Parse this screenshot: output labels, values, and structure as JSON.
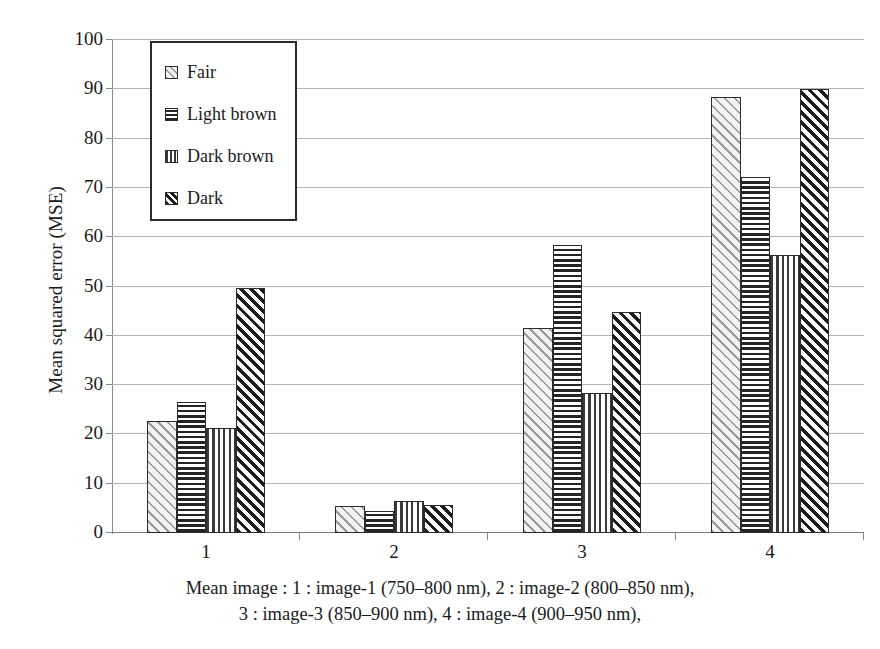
{
  "chart_data": {
    "type": "bar",
    "title": "",
    "xlabel": "",
    "ylabel": "Mean squared error (MSE)",
    "categories": [
      "1",
      "2",
      "3",
      "4"
    ],
    "ylim": [
      0,
      100
    ],
    "yticks": [
      0,
      10,
      20,
      30,
      40,
      50,
      60,
      70,
      80,
      90,
      100
    ],
    "grid": true,
    "legend_position": "upper-left-inside",
    "series": [
      {
        "name": "Fair",
        "pattern": "diagonal-forward-light",
        "values": [
          22.7,
          5.5,
          41.5,
          88.5
        ]
      },
      {
        "name": "Light brown",
        "pattern": "horizontal-lines",
        "values": [
          26.5,
          4.5,
          58.5,
          72.2
        ]
      },
      {
        "name": "Dark brown",
        "pattern": "vertical-lines",
        "values": [
          21.2,
          6.5,
          28.3,
          56.3
        ]
      },
      {
        "name": "Dark",
        "pattern": "diagonal-forward-dense",
        "values": [
          49.7,
          5.7,
          44.8,
          90.0
        ]
      }
    ],
    "caption_lines": [
      "Mean image : 1 : image-1 (750–800 nm), 2 : image-2 (800–850 nm),",
      "3 : image-3 (850–900 nm), 4 : image-4 (900–950 nm),"
    ]
  }
}
